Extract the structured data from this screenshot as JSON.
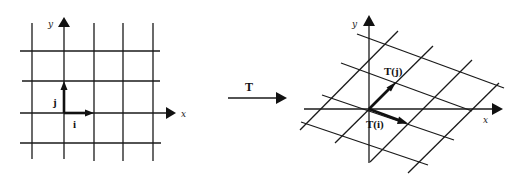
{
  "figure": {
    "left_panel": {
      "axis_labels": {
        "x": "x",
        "y": "y"
      },
      "vector_labels": {
        "i": "i",
        "j": "j"
      },
      "origin": [
        64,
        113
      ],
      "unit_px": 30,
      "grid_vertical_x": [
        32,
        64,
        94,
        123,
        153
      ],
      "grid_horizontal_y": [
        51,
        81,
        113,
        143
      ]
    },
    "transform_arrow": {
      "label": "T"
    },
    "right_panel": {
      "axis_labels": {
        "x": "x",
        "y": "y"
      },
      "vector_labels": {
        "Ti": "T(i)",
        "Tj": "T(j)"
      },
      "origin": [
        369,
        109
      ],
      "T_i_px": [
        38,
        14
      ],
      "T_j_px": [
        26,
        -26
      ]
    }
  }
}
